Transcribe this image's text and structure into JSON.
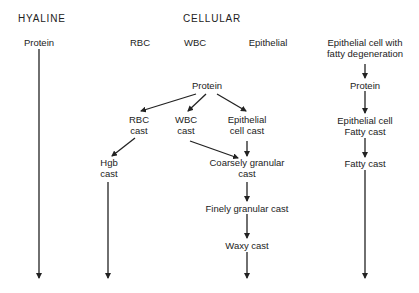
{
  "headers": {
    "hyaline": "HYALINE",
    "cellular": "CELLULAR"
  },
  "top_row": {
    "hyaline_protein": "Protein",
    "rbc": "RBC",
    "wbc": "WBC",
    "epithelial": "Epithelial",
    "epithelial_fatty_line1": "Epithelial cell with",
    "epithelial_fatty_line2": "fatty degeneration"
  },
  "cellular_flow": {
    "protein": "Protein",
    "rbc_cast_line1": "RBC",
    "rbc_cast_line2": "cast",
    "wbc_cast_line1": "WBC",
    "wbc_cast_line2": "cast",
    "epi_cast_line1": "Epithelial",
    "epi_cast_line2": "cell cast",
    "hgb_cast_line1": "Hgb",
    "hgb_cast_line2": "cast",
    "coarse_line1": "Coarsely granular",
    "coarse_line2": "cast",
    "fine": "Finely granular cast",
    "waxy": "Waxy cast"
  },
  "fatty_flow": {
    "protein": "Protein",
    "epi_fatty_line1": "Epithelial cell",
    "epi_fatty_line2": "Fatty cast",
    "fatty_cast": "Fatty cast"
  },
  "colors": {
    "line": "#222222",
    "background": "#ffffff"
  }
}
